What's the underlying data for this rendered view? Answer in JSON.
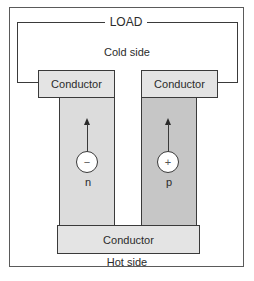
{
  "diagram": {
    "title_load": "LOAD",
    "cold_side": "Cold side",
    "hot_side": "Hot side",
    "conductors": {
      "top_left": "Conductor",
      "top_right": "Conductor",
      "bottom": "Conductor"
    },
    "legs": [
      {
        "type": "n",
        "label": "n",
        "carrier_symbol": "−",
        "carrier": "electron",
        "arrow_direction": "up",
        "color": "#dcdcdc"
      },
      {
        "type": "p",
        "label": "p",
        "carrier_symbol": "+",
        "carrier": "hole",
        "arrow_direction": "up",
        "color": "#c6c6c6"
      }
    ],
    "conductor_color": "#e4e4e4",
    "line_color": "#3a3a3a"
  }
}
